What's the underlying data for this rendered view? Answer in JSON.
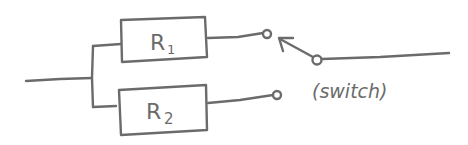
{
  "diagram": {
    "type": "circuit",
    "style": "hand-drawn",
    "stroke_color": "#6b6b6b",
    "background": "#ffffff",
    "components": {
      "r1": {
        "label": "R",
        "subscript": "1"
      },
      "r2": {
        "label": "R",
        "subscript": "2"
      },
      "switch": {
        "label": "(switch)"
      }
    }
  }
}
